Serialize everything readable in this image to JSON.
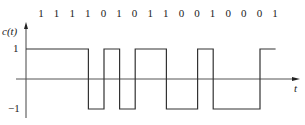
{
  "diagram": {
    "ylabel": "c(t)",
    "xlabel": "t",
    "ytick_high": "1",
    "ytick_low": "−1",
    "bits": [
      "1",
      "1",
      "1",
      "1",
      "0",
      "1",
      "0",
      "1",
      "1",
      "0",
      "0",
      "1",
      "0",
      "0",
      "0",
      "1"
    ],
    "colors": {
      "line": "#333333",
      "axis": "#555555",
      "text": "#222222"
    }
  },
  "chart_data": {
    "type": "line",
    "title": "",
    "xlabel": "t",
    "ylabel": "c(t)",
    "ylim": [
      -1,
      1
    ],
    "bit_sequence": [
      1,
      1,
      1,
      1,
      0,
      1,
      0,
      1,
      1,
      0,
      0,
      1,
      0,
      0,
      0,
      1
    ],
    "waveform_levels": [
      1,
      1,
      1,
      1,
      -1,
      1,
      -1,
      1,
      1,
      -1,
      -1,
      1,
      -1,
      -1,
      -1,
      1
    ]
  }
}
